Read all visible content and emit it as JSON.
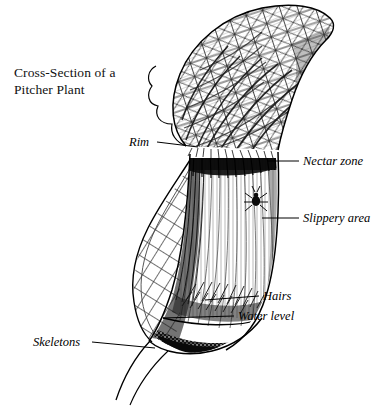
{
  "figure": {
    "title": "Cross-Section of a\nPitcher Plant",
    "background_color": "#ffffff",
    "ink_color": "#111111"
  },
  "labels": {
    "rim": "Rim",
    "nectar_zone": "Nectar zone",
    "slippery_area": "Slippery area",
    "hairs": "Hairs",
    "water_level": "Water level",
    "skeletons": "Skeletons"
  },
  "leaders": {
    "rim": {
      "x1": 157,
      "y1": 142,
      "x2": 198,
      "y2": 148
    },
    "nectar_zone": {
      "x1": 268,
      "y1": 161,
      "x2": 299,
      "y2": 161
    },
    "slippery_area": {
      "x1": 262,
      "y1": 218,
      "x2": 299,
      "y2": 218
    },
    "hairs": {
      "x1": 205,
      "y1": 300,
      "x2": 259,
      "y2": 296
    },
    "water_level": {
      "x1": 163,
      "y1": 318,
      "x2": 234,
      "y2": 316
    },
    "skeletons": {
      "x1": 92,
      "y1": 342,
      "x2": 155,
      "y2": 348
    }
  },
  "anatomy": {
    "lid": "reticulated veined operculum curving up to a point at upper right",
    "nectar_zone_band": "dark horizontal band just below the rim",
    "slippery_area": "pale vertically hatched inner wall",
    "hairs": "downward pointing hairs converging at the narrow base",
    "water_level": "horizontal line across the lower chamber",
    "skeletons": "dark stippled mass of insect remains at the bottom",
    "insect": "small dark insect on the slippery inner wall",
    "outer_wall": "cellular network texture on the outer pitcher wall",
    "stem": "two thin curved lines descending to the lower left"
  }
}
